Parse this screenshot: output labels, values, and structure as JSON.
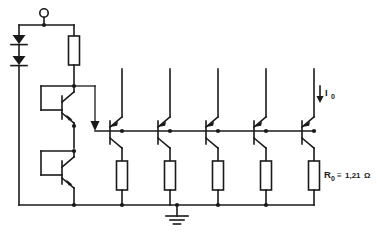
{
  "diagram": {
    "background_color": "#ffffff",
    "line_color": "#1a1a1a"
  },
  "labels": {
    "output_resistor": {
      "symbol": "R",
      "subscript": "0",
      "relation": "≡",
      "value": "1,21",
      "unit": "Ω",
      "full": "R0 ≡ 1,21Ω"
    },
    "output_current": {
      "symbol": "I",
      "subscript": "0",
      "full": "I0"
    }
  },
  "components": {
    "input_terminal": {
      "name": "input-terminal",
      "shape": "open-circle",
      "x": 44,
      "y": 13
    },
    "diodes": [
      {
        "id": "D1",
        "orientation": "down",
        "x": 19,
        "y": 41
      },
      {
        "id": "D2",
        "orientation": "down",
        "x": 19,
        "y": 62
      }
    ],
    "bias_resistor": {
      "id": "R-bias",
      "orientation": "vertical",
      "x": 74,
      "y": 50
    },
    "driver_transistors": [
      {
        "id": "Q-drv1",
        "type": "npn",
        "x": 74,
        "y": 103,
        "base_tied_to_collector": true
      },
      {
        "id": "Q-drv2",
        "type": "npn",
        "x": 74,
        "y": 168,
        "base_tied_to_collector": true
      }
    ],
    "output_transistors": [
      {
        "id": "Q1",
        "type": "npn",
        "x": 122,
        "y": 136
      },
      {
        "id": "Q2",
        "type": "npn",
        "x": 170,
        "y": 136
      },
      {
        "id": "Q3",
        "type": "npn",
        "x": 218,
        "y": 136
      },
      {
        "id": "Q4",
        "type": "npn",
        "x": 266,
        "y": 136
      },
      {
        "id": "Q5",
        "type": "npn",
        "x": 314,
        "y": 136
      }
    ],
    "emitter_resistors": [
      {
        "id": "Re1",
        "x": 122,
        "y": 175
      },
      {
        "id": "Re2",
        "x": 170,
        "y": 175
      },
      {
        "id": "Re3",
        "x": 218,
        "y": 175
      },
      {
        "id": "Re4",
        "x": 266,
        "y": 175
      },
      {
        "id": "Re5",
        "x": 314,
        "y": 175,
        "labeled": true
      }
    ],
    "ground": {
      "name": "ground-symbol",
      "x": 177,
      "y": 206
    },
    "base_rail": {
      "y": 131,
      "x_start": 95,
      "x_end": 314
    },
    "bottom_rail": {
      "y": 205,
      "x_start": 19,
      "x_end": 314
    },
    "current_arrow": {
      "name": "output-current-arrow",
      "x": 318,
      "y": 88,
      "direction": "down"
    }
  }
}
